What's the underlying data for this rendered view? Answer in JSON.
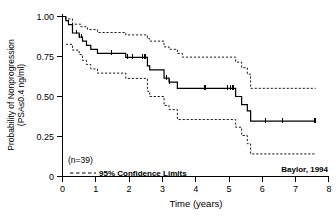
{
  "chart_data": {
    "type": "line",
    "subtype": "kaplan-meier-survival",
    "title": "",
    "xlabel": "Time (years)",
    "ylabel": "Probability of Nonprogression (PSA≤0.4 ng/ml)",
    "ylabel_line1": "Probability of Nonprogression",
    "ylabel_line2": "(PSA≤0.4 ng/ml)",
    "xlim": [
      0,
      8
    ],
    "ylim": [
      0,
      1.0
    ],
    "xticks": [
      0,
      1,
      2,
      3,
      4,
      5,
      6,
      7,
      8
    ],
    "xtick_labels": [
      "0",
      "1",
      "2",
      "3",
      "4",
      "5",
      "6",
      "7",
      "8"
    ],
    "yticks": [
      0,
      0.25,
      0.5,
      0.75,
      1.0
    ],
    "ytick_labels": [
      "0",
      "0.25",
      "0.50",
      "0.75",
      "1.00"
    ],
    "grid": false,
    "legend_position": "bottom-left",
    "sample_size_label": "(n=39)",
    "sample_size": 39,
    "legend_entries": [
      {
        "label": "95% Confidence Limits",
        "style": "dashed"
      }
    ],
    "source_note": "Baylor, 1994",
    "series": [
      {
        "name": "Kaplan-Meier estimate",
        "style": "solid",
        "steps": [
          [
            0.0,
            1.0
          ],
          [
            0.1,
            1.0
          ],
          [
            0.1,
            0.974
          ],
          [
            0.18,
            0.974
          ],
          [
            0.18,
            0.949
          ],
          [
            0.3,
            0.949
          ],
          [
            0.3,
            0.897
          ],
          [
            0.5,
            0.897
          ],
          [
            0.5,
            0.872
          ],
          [
            0.6,
            0.872
          ],
          [
            0.6,
            0.846
          ],
          [
            0.72,
            0.846
          ],
          [
            0.72,
            0.82
          ],
          [
            0.85,
            0.82
          ],
          [
            0.85,
            0.795
          ],
          [
            1.05,
            0.795
          ],
          [
            1.05,
            0.769
          ],
          [
            1.9,
            0.769
          ],
          [
            1.9,
            0.744
          ],
          [
            2.55,
            0.744
          ],
          [
            2.55,
            0.692
          ],
          [
            2.62,
            0.692
          ],
          [
            2.62,
            0.667
          ],
          [
            3.05,
            0.667
          ],
          [
            3.05,
            0.615
          ],
          [
            3.2,
            0.615
          ],
          [
            3.2,
            0.59
          ],
          [
            3.45,
            0.59
          ],
          [
            3.45,
            0.551
          ],
          [
            5.2,
            0.551
          ],
          [
            5.2,
            0.5
          ],
          [
            5.38,
            0.5
          ],
          [
            5.38,
            0.449
          ],
          [
            5.55,
            0.449
          ],
          [
            5.55,
            0.41
          ],
          [
            5.65,
            0.41
          ],
          [
            5.65,
            0.346
          ],
          [
            7.6,
            0.346
          ]
        ],
        "censor_times": [
          0.42,
          0.5,
          0.58,
          1.47,
          1.95,
          2.1,
          2.4,
          2.48,
          3.12,
          3.22,
          4.28,
          4.95,
          5.05,
          5.12,
          6.1,
          6.6,
          7.58
        ],
        "final_value": 0.346
      },
      {
        "name": "Upper 95% confidence limit",
        "style": "dashed",
        "steps": [
          [
            0.0,
            1.0
          ],
          [
            0.1,
            1.0
          ],
          [
            0.1,
            0.985
          ],
          [
            0.3,
            0.985
          ],
          [
            0.3,
            0.952
          ],
          [
            0.55,
            0.952
          ],
          [
            0.55,
            0.936
          ],
          [
            0.75,
            0.936
          ],
          [
            0.75,
            0.918
          ],
          [
            1.05,
            0.918
          ],
          [
            1.05,
            0.9
          ],
          [
            1.9,
            0.9
          ],
          [
            1.9,
            0.885
          ],
          [
            2.55,
            0.885
          ],
          [
            2.55,
            0.862
          ],
          [
            2.62,
            0.862
          ],
          [
            2.62,
            0.846
          ],
          [
            3.05,
            0.846
          ],
          [
            3.05,
            0.81
          ],
          [
            3.2,
            0.81
          ],
          [
            3.2,
            0.795
          ],
          [
            3.45,
            0.795
          ],
          [
            3.45,
            0.769
          ],
          [
            3.6,
            0.769
          ],
          [
            3.6,
            0.746
          ],
          [
            5.2,
            0.746
          ],
          [
            5.2,
            0.715
          ],
          [
            5.38,
            0.715
          ],
          [
            5.38,
            0.68
          ],
          [
            5.55,
            0.68
          ],
          [
            5.55,
            0.64
          ],
          [
            5.65,
            0.64
          ],
          [
            5.65,
            0.551
          ],
          [
            7.6,
            0.551
          ]
        ],
        "final_value": 0.551
      },
      {
        "name": "Lower 95% confidence limit",
        "style": "dashed",
        "steps": [
          [
            0.1,
            0.826
          ],
          [
            0.3,
            0.826
          ],
          [
            0.3,
            0.79
          ],
          [
            0.5,
            0.79
          ],
          [
            0.5,
            0.762
          ],
          [
            0.6,
            0.762
          ],
          [
            0.6,
            0.726
          ],
          [
            0.72,
            0.726
          ],
          [
            0.72,
            0.7
          ],
          [
            0.85,
            0.7
          ],
          [
            0.85,
            0.672
          ],
          [
            1.05,
            0.672
          ],
          [
            1.05,
            0.646
          ],
          [
            1.9,
            0.646
          ],
          [
            1.9,
            0.613
          ],
          [
            2.55,
            0.613
          ],
          [
            2.55,
            0.533
          ],
          [
            2.62,
            0.533
          ],
          [
            2.62,
            0.5
          ],
          [
            3.05,
            0.5
          ],
          [
            3.05,
            0.444
          ],
          [
            3.2,
            0.444
          ],
          [
            3.2,
            0.418
          ],
          [
            3.45,
            0.418
          ],
          [
            3.45,
            0.356
          ],
          [
            5.2,
            0.356
          ],
          [
            5.2,
            0.308
          ],
          [
            5.38,
            0.308
          ],
          [
            5.38,
            0.256
          ],
          [
            5.55,
            0.256
          ],
          [
            5.55,
            0.205
          ],
          [
            5.65,
            0.205
          ],
          [
            5.65,
            0.141
          ],
          [
            7.6,
            0.141
          ]
        ],
        "final_value": 0.141
      }
    ]
  },
  "axes": {
    "x": {
      "title": "Time (years)",
      "labels": [
        "0",
        "1",
        "2",
        "3",
        "4",
        "5",
        "6",
        "7",
        "8"
      ]
    },
    "y": {
      "title_line1": "Probability of Nonprogression",
      "title_line2": "(PSA≤0.4 ng/ml)",
      "labels": [
        "1.00",
        "0.75",
        "0.50",
        "0.25",
        "0"
      ]
    }
  },
  "annotations": {
    "sample_size": "(n=39)",
    "legend_text": "95% Confidence Limits",
    "source": "Baylor, 1994"
  },
  "colors": {
    "background": "#ffffff",
    "ink": "#000000",
    "curve": "#000000",
    "confidence": "#000000"
  }
}
